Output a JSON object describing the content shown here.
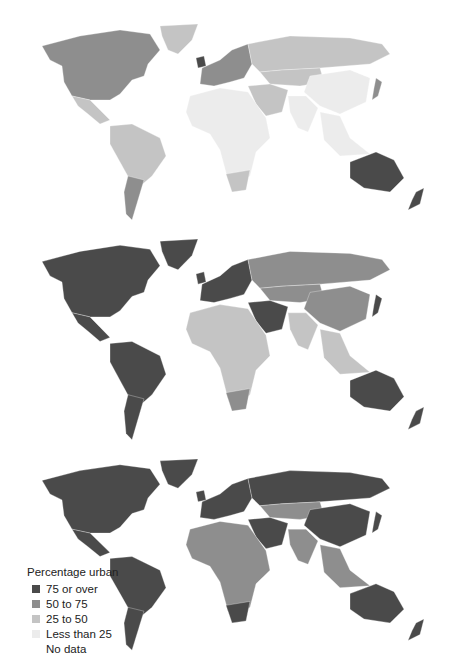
{
  "legend": {
    "title": "Percentage urban",
    "items": [
      {
        "label": "75 or over",
        "color": "#4a4a4a"
      },
      {
        "label": "50 to 75",
        "color": "#8e8e8e"
      },
      {
        "label": "25 to 50",
        "color": "#c4c4c4"
      },
      {
        "label": "Less than 25",
        "color": "#ececec"
      },
      {
        "label": "No data",
        "color": "#ffffff"
      }
    ]
  },
  "maps": [
    {
      "id": "map1",
      "regions": {
        "north_america": "#8e8e8e",
        "greenland": "#c4c4c4",
        "mexico": "#c4c4c4",
        "south_america": "#c4c4c4",
        "argentina": "#8e8e8e",
        "europe_west": "#8e8e8e",
        "uk": "#4a4a4a",
        "russia": "#c4c4c4",
        "central_asia": "#c4c4c4",
        "china": "#ececec",
        "india": "#ececec",
        "africa": "#ececec",
        "south_africa": "#c4c4c4",
        "middle_east": "#c4c4c4",
        "japan": "#8e8e8e",
        "se_asia": "#ececec",
        "australia": "#4a4a4a",
        "new_zealand": "#4a4a4a"
      }
    },
    {
      "id": "map2",
      "regions": {
        "north_america": "#4a4a4a",
        "greenland": "#4a4a4a",
        "mexico": "#4a4a4a",
        "south_america": "#4a4a4a",
        "argentina": "#4a4a4a",
        "europe_west": "#4a4a4a",
        "uk": "#4a4a4a",
        "russia": "#8e8e8e",
        "central_asia": "#8e8e8e",
        "china": "#8e8e8e",
        "india": "#c4c4c4",
        "africa": "#c4c4c4",
        "south_africa": "#8e8e8e",
        "middle_east": "#4a4a4a",
        "japan": "#4a4a4a",
        "se_asia": "#c4c4c4",
        "australia": "#4a4a4a",
        "new_zealand": "#4a4a4a"
      }
    },
    {
      "id": "map3",
      "regions": {
        "north_america": "#4a4a4a",
        "greenland": "#4a4a4a",
        "mexico": "#4a4a4a",
        "south_america": "#4a4a4a",
        "argentina": "#4a4a4a",
        "europe_west": "#4a4a4a",
        "uk": "#4a4a4a",
        "russia": "#4a4a4a",
        "central_asia": "#8e8e8e",
        "china": "#4a4a4a",
        "india": "#8e8e8e",
        "africa": "#8e8e8e",
        "south_africa": "#4a4a4a",
        "middle_east": "#4a4a4a",
        "japan": "#4a4a4a",
        "se_asia": "#8e8e8e",
        "australia": "#4a4a4a",
        "new_zealand": "#4a4a4a"
      }
    }
  ]
}
